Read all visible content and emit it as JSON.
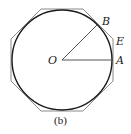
{
  "diagram": {
    "caption": "(b)",
    "shapes": {
      "circle": {
        "cx": 62,
        "cy": 60,
        "r": 50,
        "stroke": "#1a1a1a"
      },
      "octagon": {
        "sides": 8,
        "circumscribed": true,
        "stroke": "#888888"
      }
    },
    "points": {
      "O": {
        "label": "O"
      },
      "A": {
        "label": "A"
      },
      "B": {
        "label": "B"
      },
      "E": {
        "label": "E"
      }
    },
    "segments": [
      "OA",
      "OB"
    ]
  }
}
